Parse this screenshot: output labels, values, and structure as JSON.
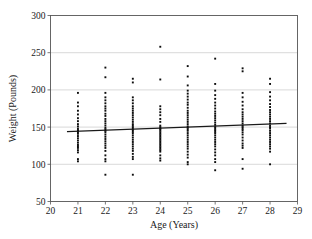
{
  "chart_data": {
    "type": "scatter",
    "title": "",
    "xlabel": "Age (Years)",
    "ylabel": "Weight (Pounds)",
    "xlim": [
      20,
      29
    ],
    "ylim": [
      50,
      300
    ],
    "xticks": [
      20,
      21,
      22,
      23,
      24,
      25,
      26,
      27,
      28,
      29
    ],
    "yticks": [
      50,
      100,
      150,
      200,
      250,
      300
    ],
    "grid": "horizontal",
    "legend": "none",
    "marker_color": "#0d0d0d",
    "gridline_color": "#c9c9c9",
    "frame_color": "#555555",
    "trendline": {
      "color": "#1a1a1a",
      "x_start": 20.6,
      "y_start": 144,
      "x_end": 28.6,
      "y_end": 155
    },
    "series": [
      {
        "name": "Age 21",
        "x": 21,
        "values": [
          196,
          183,
          178,
          172,
          167,
          162,
          158,
          154,
          151,
          148,
          146,
          145,
          143,
          141,
          138,
          135,
          132,
          129,
          126,
          124,
          122,
          119,
          116,
          107,
          104
        ]
      },
      {
        "name": "Age 22",
        "x": 22,
        "values": [
          230,
          217,
          196,
          190,
          186,
          182,
          178,
          175,
          172,
          168,
          165,
          161,
          158,
          155,
          152,
          149,
          147,
          145,
          143,
          140,
          137,
          134,
          131,
          128,
          125,
          122,
          118,
          112,
          107,
          104,
          86
        ]
      },
      {
        "name": "Age 23",
        "x": 23,
        "values": [
          215,
          210,
          190,
          186,
          182,
          178,
          175,
          172,
          169,
          166,
          163,
          160,
          157,
          154,
          152,
          150,
          148,
          146,
          144,
          142,
          139,
          136,
          133,
          130,
          127,
          124,
          121,
          118,
          114,
          110,
          107,
          86
        ]
      },
      {
        "name": "Age 24",
        "x": 24,
        "values": [
          258,
          214,
          178,
          174,
          170,
          166,
          161,
          157,
          152,
          150,
          148,
          147,
          145,
          143,
          141,
          139,
          137,
          135,
          133,
          131,
          129,
          127,
          125,
          123,
          121,
          119,
          117,
          112,
          108,
          105
        ]
      },
      {
        "name": "Age 25",
        "x": 25,
        "values": [
          232,
          218,
          206,
          199,
          195,
          191,
          187,
          183,
          180,
          176,
          172,
          169,
          166,
          163,
          160,
          157,
          154,
          151,
          149,
          147,
          145,
          142,
          139,
          136,
          133,
          130,
          127,
          124,
          121,
          117,
          113,
          109,
          103,
          100
        ]
      },
      {
        "name": "Age 26",
        "x": 26,
        "values": [
          242,
          208,
          199,
          193,
          188,
          183,
          179,
          175,
          171,
          168,
          165,
          162,
          159,
          156,
          153,
          150,
          148,
          146,
          144,
          142,
          139,
          136,
          133,
          130,
          127,
          124,
          120,
          116,
          112,
          107,
          103,
          92
        ]
      },
      {
        "name": "Age 27",
        "x": 27,
        "values": [
          229,
          225,
          196,
          190,
          184,
          179,
          174,
          170,
          167,
          164,
          161,
          158,
          155,
          152,
          150,
          148,
          146,
          143,
          140,
          136,
          132,
          128,
          125,
          122,
          107,
          94
        ]
      },
      {
        "name": "Age 28",
        "x": 28,
        "values": [
          215,
          208,
          197,
          191,
          186,
          181,
          177,
          173,
          170,
          167,
          164,
          161,
          158,
          155,
          152,
          150,
          148,
          145,
          142,
          139,
          136,
          133,
          130,
          127,
          124,
          121,
          117,
          100
        ]
      }
    ]
  }
}
